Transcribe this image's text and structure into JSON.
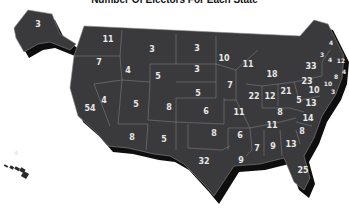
{
  "title": "Number Of Electors For Each State",
  "colors": {
    "land": "#3a3a3d",
    "shadow": "#0e0e0e",
    "border": "#8a8a8a",
    "label": "#e8e8e8",
    "background": "#ffffff"
  },
  "states": [
    {
      "name": "Alaska",
      "electors": "3",
      "x": 38,
      "y": 25
    },
    {
      "name": "Washington",
      "electors": "11",
      "x": 108,
      "y": 40
    },
    {
      "name": "Oregon",
      "electors": "7",
      "x": 99,
      "y": 63
    },
    {
      "name": "Idaho",
      "electors": "4",
      "x": 128,
      "y": 71
    },
    {
      "name": "Montana",
      "electors": "3",
      "x": 152,
      "y": 50
    },
    {
      "name": "Wyoming",
      "electors": "5",
      "x": 158,
      "y": 77
    },
    {
      "name": "North Dakota",
      "electors": "3",
      "x": 197,
      "y": 49
    },
    {
      "name": "South Dakota",
      "electors": "3",
      "x": 197,
      "y": 70
    },
    {
      "name": "Nebraska",
      "electors": "5",
      "x": 198,
      "y": 94
    },
    {
      "name": "Minnesota",
      "electors": "10",
      "x": 224,
      "y": 59
    },
    {
      "name": "Wisconsin",
      "electors": "11",
      "x": 248,
      "y": 65
    },
    {
      "name": "Michigan",
      "electors": "18",
      "x": 272,
      "y": 75
    },
    {
      "name": "Iowa",
      "electors": "7",
      "x": 230,
      "y": 86
    },
    {
      "name": "Illinois",
      "electors": "22",
      "x": 254,
      "y": 97
    },
    {
      "name": "Indiana",
      "electors": "12",
      "x": 270,
      "y": 97
    },
    {
      "name": "Ohio",
      "electors": "21",
      "x": 286,
      "y": 92
    },
    {
      "name": "Pennsylvania",
      "electors": "23",
      "x": 307,
      "y": 82
    },
    {
      "name": "New York",
      "electors": "33",
      "x": 311,
      "y": 67
    },
    {
      "name": "New Jersey",
      "electors": "10",
      "x": 314,
      "y": 91
    },
    {
      "name": "West Virginia",
      "electors": "5",
      "x": 299,
      "y": 101
    },
    {
      "name": "Virginia",
      "electors": "13",
      "x": 311,
      "y": 104
    },
    {
      "name": "North Carolina",
      "electors": "14",
      "x": 308,
      "y": 119
    },
    {
      "name": "South Carolina",
      "electors": "8",
      "x": 302,
      "y": 132
    },
    {
      "name": "Georgia",
      "electors": "13",
      "x": 291,
      "y": 145
    },
    {
      "name": "Florida",
      "electors": "25",
      "x": 303,
      "y": 171
    },
    {
      "name": "Alabama",
      "electors": "9",
      "x": 273,
      "y": 147
    },
    {
      "name": "Mississippi",
      "electors": "7",
      "x": 257,
      "y": 149
    },
    {
      "name": "Louisiana",
      "electors": "9",
      "x": 241,
      "y": 161
    },
    {
      "name": "Arkansas",
      "electors": "6",
      "x": 240,
      "y": 136
    },
    {
      "name": "Tennessee",
      "electors": "11",
      "x": 272,
      "y": 126
    },
    {
      "name": "Kentucky",
      "electors": "8",
      "x": 280,
      "y": 113
    },
    {
      "name": "Missouri",
      "electors": "11",
      "x": 239,
      "y": 113
    },
    {
      "name": "Kansas",
      "electors": "6",
      "x": 206,
      "y": 112
    },
    {
      "name": "Oklahoma",
      "electors": "8",
      "x": 214,
      "y": 134
    },
    {
      "name": "Texas",
      "electors": "32",
      "x": 204,
      "y": 162
    },
    {
      "name": "New Mexico",
      "electors": "5",
      "x": 164,
      "y": 140
    },
    {
      "name": "Arizona",
      "electors": "8",
      "x": 132,
      "y": 138
    },
    {
      "name": "Colorado",
      "electors": "8",
      "x": 169,
      "y": 108
    },
    {
      "name": "Utah",
      "electors": "5",
      "x": 136,
      "y": 105
    },
    {
      "name": "Nevada",
      "electors": "4",
      "x": 104,
      "y": 101
    },
    {
      "name": "California",
      "electors": "54",
      "x": 90,
      "y": 109
    },
    {
      "name": "Maine",
      "electors": "4",
      "x": 331,
      "y": 43
    },
    {
      "name": "Vermont",
      "electors": "3",
      "x": 322,
      "y": 55
    },
    {
      "name": "New Hampshire",
      "electors": "4",
      "x": 330,
      "y": 60
    },
    {
      "name": "Massachusetts",
      "electors": "12",
      "x": 341,
      "y": 61
    },
    {
      "name": "Rhode Island",
      "electors": "4",
      "x": 344,
      "y": 72
    },
    {
      "name": "Connecticut",
      "electors": "8",
      "x": 336,
      "y": 77
    },
    {
      "name": "Maryland",
      "electors": "10",
      "x": 328,
      "y": 84
    },
    {
      "name": "Delaware",
      "electors": "3",
      "x": 333,
      "y": 92
    },
    {
      "name": "Hawaii",
      "electors": "4",
      "x": 16,
      "y": 153
    }
  ]
}
